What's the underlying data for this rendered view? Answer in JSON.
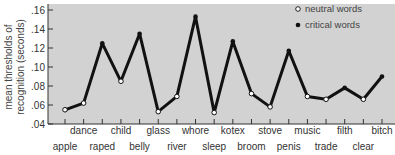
{
  "chart_data": {
    "type": "line",
    "title": "",
    "xlabel": "",
    "ylabel": "mean thresholds of recognition (seconds)",
    "ylabel_lines": [
      "mean thresholds of",
      "recognition (seconds)"
    ],
    "ylim": [
      0.04,
      0.16
    ],
    "yticks": [
      ".04",
      ".06",
      ".08",
      ".10",
      ".12",
      ".14",
      ".16"
    ],
    "grid": false,
    "legend_position": "top-right",
    "legend": [
      {
        "name": "neutral words",
        "marker": "open-circle"
      },
      {
        "name": "critical words",
        "marker": "filled-circle"
      }
    ],
    "categories": [
      "apple",
      "dance",
      "raped",
      "child",
      "belly",
      "glass",
      "river",
      "whore",
      "sleep",
      "kotex",
      "broom",
      "stove",
      "penis",
      "music",
      "trade",
      "filth",
      "clear",
      "bitch"
    ],
    "values": [
      0.055,
      0.062,
      0.125,
      0.085,
      0.135,
      0.053,
      0.069,
      0.153,
      0.052,
      0.127,
      0.072,
      0.058,
      0.117,
      0.069,
      0.066,
      0.078,
      0.066,
      0.09
    ],
    "word_type": [
      "neutral",
      "neutral",
      "critical",
      "neutral",
      "critical",
      "neutral",
      "neutral",
      "critical",
      "neutral",
      "critical",
      "neutral",
      "neutral",
      "critical",
      "neutral",
      "neutral",
      "critical",
      "neutral",
      "critical"
    ],
    "series": [
      {
        "name": "neutral words",
        "points": {
          "apple": 0.055,
          "dance": 0.062,
          "child": 0.085,
          "glass": 0.053,
          "river": 0.069,
          "sleep": 0.052,
          "broom": 0.072,
          "stove": 0.058,
          "music": 0.069,
          "trade": 0.066,
          "clear": 0.066
        }
      },
      {
        "name": "critical words",
        "points": {
          "raped": 0.125,
          "belly": 0.135,
          "whore": 0.153,
          "kotex": 0.127,
          "penis": 0.117,
          "filth": 0.078,
          "bitch": 0.09
        }
      }
    ]
  },
  "colors": {
    "plot_bg": "#d2d2d2",
    "line": "#111111",
    "text": "#333333"
  }
}
